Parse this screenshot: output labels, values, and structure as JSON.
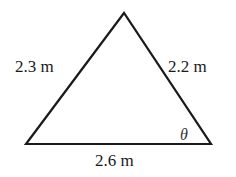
{
  "diagram": {
    "type": "triangle",
    "stroke_color": "#1a1a1a",
    "vertices": {
      "top": [
        124,
        13
      ],
      "bottom_left": [
        26,
        144
      ],
      "bottom_right": [
        211,
        144
      ]
    },
    "sides": {
      "left": "2.3 m",
      "right": "2.2 m",
      "bottom": "2.6 m"
    },
    "angle_label": "θ"
  }
}
